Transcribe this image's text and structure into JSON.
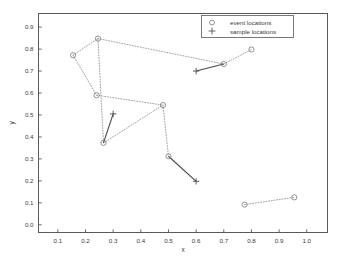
{
  "chart_data": {
    "type": "scatter",
    "title": "",
    "xlabel": "x",
    "ylabel": "y",
    "xlim": [
      0.03,
      1.075
    ],
    "ylim": [
      -0.035,
      0.962
    ],
    "xticks": [
      "0.1",
      "0.2",
      "0.3",
      "0.4",
      "0.5",
      "0.6",
      "0.7",
      "0.8",
      "0.9",
      "1.0"
    ],
    "xtick_values": [
      0.1,
      0.2,
      0.3,
      0.4,
      0.5,
      0.6,
      0.7,
      0.8,
      0.9,
      1.0
    ],
    "yticks": [
      "0.0",
      "0.1",
      "0.2",
      "0.3",
      "0.4",
      "0.5",
      "0.6",
      "0.7",
      "0.8",
      "0.9"
    ],
    "ytick_values": [
      0.0,
      0.1,
      0.2,
      0.3,
      0.4,
      0.5,
      0.6,
      0.7,
      0.8,
      0.9
    ],
    "grid": false,
    "legend_position": "upper right",
    "series": [
      {
        "name": "event locations",
        "marker": "circle",
        "color": "#808080",
        "points": [
          {
            "x": 0.155,
            "y": 0.772
          },
          {
            "x": 0.245,
            "y": 0.848
          },
          {
            "x": 0.24,
            "y": 0.59
          },
          {
            "x": 0.265,
            "y": 0.373
          },
          {
            "x": 0.48,
            "y": 0.545
          },
          {
            "x": 0.5,
            "y": 0.312
          },
          {
            "x": 0.7,
            "y": 0.732
          },
          {
            "x": 0.8,
            "y": 0.798
          },
          {
            "x": 0.775,
            "y": 0.092
          },
          {
            "x": 0.955,
            "y": 0.125
          }
        ]
      },
      {
        "name": "sample locations",
        "marker": "plus",
        "color": "#555555",
        "points": [
          {
            "x": 0.3,
            "y": 0.505
          },
          {
            "x": 0.6,
            "y": 0.7
          },
          {
            "x": 0.6,
            "y": 0.198
          }
        ]
      }
    ],
    "dotted_connections": [
      {
        "x1": 0.155,
        "y1": 0.772,
        "x2": 0.245,
        "y2": 0.848
      },
      {
        "x1": 0.155,
        "y1": 0.772,
        "x2": 0.24,
        "y2": 0.59
      },
      {
        "x1": 0.245,
        "y1": 0.848,
        "x2": 0.265,
        "y2": 0.373
      },
      {
        "x1": 0.245,
        "y1": 0.848,
        "x2": 0.7,
        "y2": 0.732
      },
      {
        "x1": 0.7,
        "y1": 0.732,
        "x2": 0.8,
        "y2": 0.798
      },
      {
        "x1": 0.24,
        "y1": 0.59,
        "x2": 0.48,
        "y2": 0.545
      },
      {
        "x1": 0.265,
        "y1": 0.373,
        "x2": 0.48,
        "y2": 0.545
      },
      {
        "x1": 0.48,
        "y1": 0.545,
        "x2": 0.5,
        "y2": 0.312
      },
      {
        "x1": 0.775,
        "y1": 0.092,
        "x2": 0.955,
        "y2": 0.125
      }
    ],
    "solid_connections": [
      {
        "x1": 0.265,
        "y1": 0.373,
        "x2": 0.3,
        "y2": 0.505
      },
      {
        "x1": 0.6,
        "y1": 0.7,
        "x2": 0.7,
        "y2": 0.732
      },
      {
        "x1": 0.5,
        "y1": 0.312,
        "x2": 0.6,
        "y2": 0.198
      }
    ]
  },
  "legend": {
    "entries": [
      {
        "label": "event locations",
        "marker": "circle"
      },
      {
        "label": "sample locations",
        "marker": "plus"
      }
    ]
  },
  "colors": {
    "frame": "#5a5a5a",
    "dotted_line": "#9a9a9a",
    "solid_line": "#4a4a4a",
    "marker": "#7c7c7c",
    "text": "#3a3a3a",
    "background": "#ffffff"
  }
}
